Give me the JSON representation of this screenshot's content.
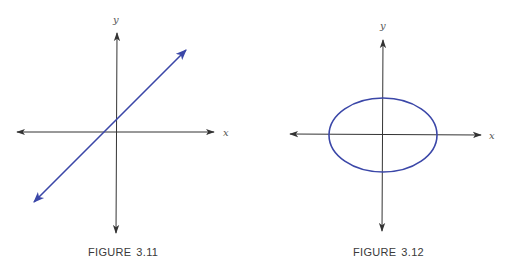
{
  "figures": [
    {
      "id": "3.11",
      "caption_label": "FIGURE",
      "caption_number": "3.11",
      "axes": {
        "x_label": "x",
        "y_label": "y"
      },
      "curve": {
        "type": "line",
        "description": "straight line with arrows at both ends, positive slope, crossing x-axis left of origin and y-axis above origin",
        "color": "#3b47a8"
      }
    },
    {
      "id": "3.12",
      "caption_label": "FIGURE",
      "caption_number": "3.12",
      "axes": {
        "x_label": "x",
        "y_label": "y"
      },
      "curve": {
        "type": "ellipse",
        "description": "ellipse centered at origin, wider than tall",
        "color": "#3b47a8"
      }
    }
  ],
  "colors": {
    "axis": "#333333",
    "curve": "#3b47a8",
    "background": "#ffffff"
  }
}
